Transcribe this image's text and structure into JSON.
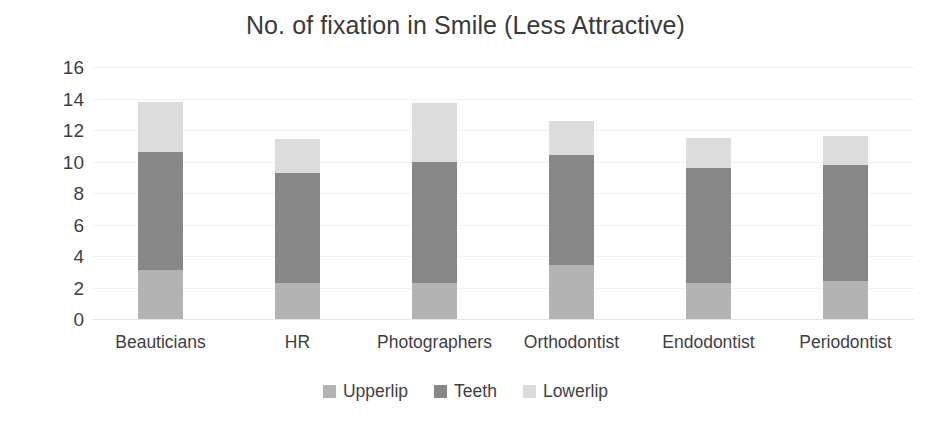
{
  "chart_data": {
    "type": "bar",
    "subtype": "stacked-column",
    "title": "No. of fixation in Smile (Less Attractive)",
    "xlabel": "",
    "ylabel": "",
    "ylim": [
      0,
      16
    ],
    "ytick_step": 2,
    "yticks": [
      "16",
      "14",
      "12",
      "10",
      "8",
      "6",
      "4",
      "2",
      "0"
    ],
    "grid": true,
    "grid_axis": "y",
    "legend_position": "bottom",
    "categories": [
      "Beauticians",
      "HR",
      "Photographers",
      "Orthodontist",
      "Endodontist",
      "Periodontist"
    ],
    "series": [
      {
        "name": "Upperlip",
        "color": "#b3b3b3",
        "values": [
          3.1,
          2.3,
          2.3,
          3.4,
          2.3,
          2.4
        ]
      },
      {
        "name": "Teeth",
        "color": "#878787",
        "values": [
          7.5,
          7.0,
          7.7,
          7.0,
          7.3,
          7.4
        ]
      },
      {
        "name": "Lowerlip",
        "color": "#dcdcdc",
        "values": [
          3.2,
          2.1,
          3.7,
          2.2,
          1.9,
          1.8
        ]
      }
    ],
    "totals": [
      13.8,
      11.4,
      13.7,
      12.6,
      11.5,
      11.6
    ]
  },
  "legend": {
    "items": [
      {
        "label": "Upperlip",
        "color": "#b3b3b3"
      },
      {
        "label": "Teeth",
        "color": "#878787"
      },
      {
        "label": "Lowerlip",
        "color": "#dcdcdc"
      }
    ]
  },
  "colors": {
    "background": "#ffffff",
    "text": "#3f3f3f",
    "gridline": "#f2f2f2",
    "upperlip": "#b3b3b3",
    "teeth": "#878787",
    "lowerlip": "#dcdcdc"
  }
}
